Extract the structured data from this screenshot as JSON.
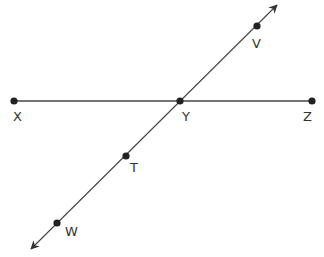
{
  "diagram": {
    "type": "geometry-lines",
    "colors": {
      "line": "#444444",
      "point": "#222222",
      "label": "#333333",
      "background": "#ffffff"
    },
    "points": [
      {
        "id": "V",
        "label": "V",
        "x": 257,
        "y": 26,
        "label_x": 252,
        "label_y": 48
      },
      {
        "id": "X",
        "label": "X",
        "x": 14,
        "y": 101,
        "label_x": 13,
        "label_y": 121
      },
      {
        "id": "Y",
        "label": "Y",
        "x": 180,
        "y": 101,
        "label_x": 182,
        "label_y": 121
      },
      {
        "id": "Z",
        "label": "Z",
        "x": 312,
        "y": 101,
        "label_x": 303,
        "label_y": 121
      },
      {
        "id": "T",
        "label": "T",
        "x": 126,
        "y": 156,
        "label_x": 130,
        "label_y": 172
      },
      {
        "id": "W",
        "label": "W",
        "x": 57,
        "y": 223,
        "label_x": 65,
        "label_y": 236
      }
    ],
    "segments": [
      {
        "id": "XZ",
        "from": "X",
        "to": "Z",
        "arrows": false
      }
    ],
    "lines": [
      {
        "id": "VW",
        "x1": 277,
        "y1": 5,
        "x2": 31,
        "y2": 249,
        "arrows": "both"
      }
    ]
  }
}
